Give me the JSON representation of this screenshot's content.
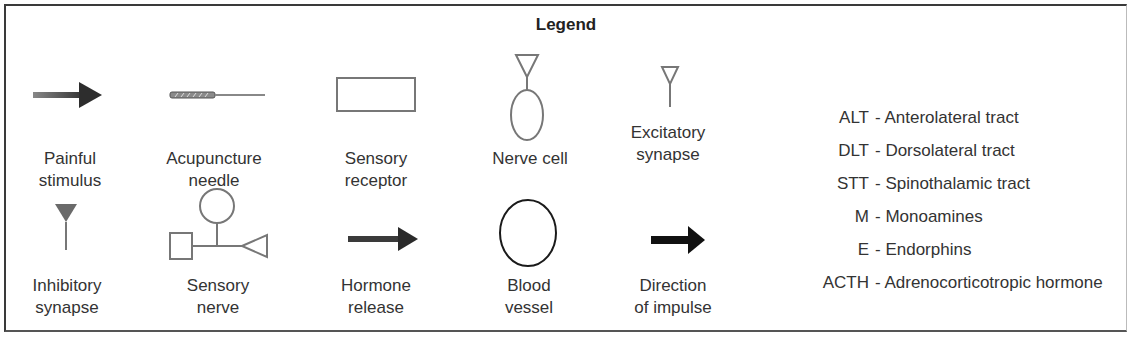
{
  "legend": {
    "title": "Legend",
    "symbols_row1": [
      {
        "id": "painful-stimulus",
        "icon": "gradient-arrow-icon",
        "label": "Painful\nstimulus"
      },
      {
        "id": "acupuncture-needle",
        "icon": "needle-icon",
        "label": "Acupuncture\nneedle"
      },
      {
        "id": "sensory-receptor",
        "icon": "rectangle-icon",
        "label": "Sensory\nreceptor"
      },
      {
        "id": "nerve-cell",
        "icon": "nerve-cell-icon",
        "label": "Nerve cell"
      },
      {
        "id": "excitatory-synapse",
        "icon": "open-triangle-synapse-icon",
        "label": "Excitatory\nsynapse"
      }
    ],
    "symbols_row2": [
      {
        "id": "inhibitory-synapse",
        "icon": "filled-triangle-synapse-icon",
        "label": "Inhibitory\nsynapse"
      },
      {
        "id": "sensory-nerve",
        "icon": "sensory-nerve-icon",
        "label": "Sensory\nnerve"
      },
      {
        "id": "hormone-release",
        "icon": "dark-arrow-icon",
        "label": "Hormone\nrelease"
      },
      {
        "id": "blood-vessel",
        "icon": "ellipse-icon",
        "label": "Blood\nvessel"
      },
      {
        "id": "direction-of-impulse",
        "icon": "black-arrow-icon",
        "label": "Direction\nof impulse"
      }
    ],
    "abbreviations": [
      {
        "key": "ALT",
        "value": "- Anterolateral tract"
      },
      {
        "key": "DLT",
        "value": "- Dorsolateral tract"
      },
      {
        "key": "STT",
        "value": "- Spinothalamic tract"
      },
      {
        "key": "M",
        "value": "- Monoamines"
      },
      {
        "key": "E",
        "value": "- Endorphins"
      },
      {
        "key": "ACTH",
        "value": "- Adrenocorticotropic hormone"
      }
    ],
    "colors": {
      "border": "#3a3a3a",
      "symbol_gray": "#777777",
      "symbol_dark": "#333333",
      "text": "#333333"
    }
  }
}
